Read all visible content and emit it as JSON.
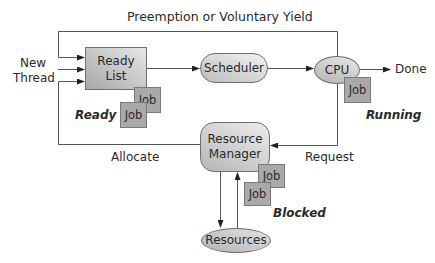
{
  "diagram": {
    "title_edge_label": "Preemption or Voluntary Yield",
    "input_label_line1": "New",
    "input_label_line2": "Thread",
    "nodes": {
      "ready_list": {
        "line1": "Ready",
        "line2": "List"
      },
      "scheduler": {
        "label": "Scheduler"
      },
      "cpu": {
        "label": "CPU"
      },
      "resource_manager": {
        "line1": "Resource",
        "line2": "Manager"
      },
      "resources": {
        "label": "Resources"
      }
    },
    "jobs": {
      "ready_job_1": "Job",
      "ready_job_2": "Job",
      "cpu_job": "Job",
      "blocked_job_1": "Job",
      "blocked_job_2": "Job"
    },
    "state_labels": {
      "ready": "Ready",
      "running": "Running",
      "blocked": "Blocked"
    },
    "edge_labels": {
      "done": "Done",
      "allocate": "Allocate",
      "request": "Request"
    },
    "colors": {
      "line": "#555555",
      "job_fill": "#a9a9a9",
      "node_fill": "#cfcfcf"
    }
  }
}
